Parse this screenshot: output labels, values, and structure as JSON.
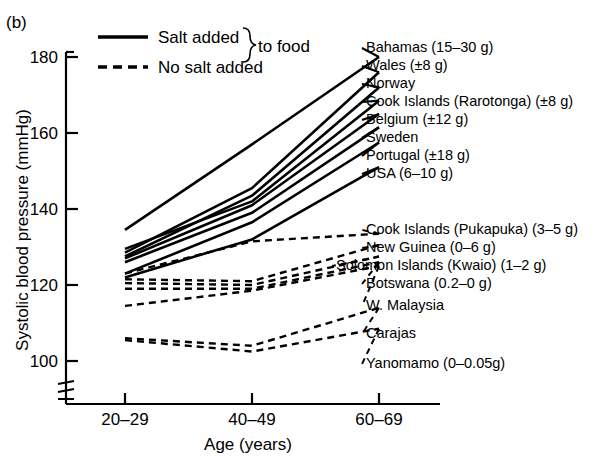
{
  "panel": {
    "letter": "(b)"
  },
  "legend": {
    "solid_label": "Salt added",
    "dashed_label": "No salt added",
    "brace_label": "to food"
  },
  "axes": {
    "y_title": "Systolic blood pressure (mmHg)",
    "x_title": "Age (years)",
    "y_ticks": [
      "180",
      "160",
      "140",
      "120",
      "100"
    ],
    "x_ticks": [
      "20–29",
      "40–49",
      "60–69"
    ],
    "y_break": "axis-break"
  },
  "chart_data": {
    "type": "line",
    "xlabel": "Age (years)",
    "ylabel": "Systolic blood pressure (mmHg)",
    "categories": [
      "20–29",
      "40–49",
      "60–69"
    ],
    "x": [
      25,
      45,
      65
    ],
    "ylim": [
      96,
      180
    ],
    "xlim": [
      20,
      70
    ],
    "grid": false,
    "legend": {
      "position": "top-left",
      "entries": [
        {
          "name": "Salt added",
          "style": "solid",
          "group": "to food"
        },
        {
          "name": "No salt added",
          "style": "dashed",
          "group": "to food"
        }
      ]
    },
    "series": [
      {
        "name": "Bahamas (15–30 g)",
        "label": "Bahamas (15–30 g)",
        "style": "solid",
        "values": [
          134.5,
          157.0,
          180.0
        ]
      },
      {
        "name": "Wales (±8 g)",
        "label": "Wales (±8 g)",
        "style": "solid",
        "values": [
          128.5,
          145.5,
          176.0
        ]
      },
      {
        "name": "Norway",
        "label": "Norway",
        "style": "solid",
        "values": [
          127.5,
          143.5,
          172.0
        ]
      },
      {
        "name": "Cook Islands (Rarotonga) (±8 g)",
        "label": "Cook Islands (Rarotonga) (±8 g)",
        "style": "solid",
        "values": [
          129.5,
          142.0,
          168.5
        ]
      },
      {
        "name": "Belgium (±12 g)",
        "label": "Belgium (±12 g)",
        "style": "solid",
        "values": [
          127.0,
          141.0,
          165.0
        ]
      },
      {
        "name": "Sweden",
        "label": "Sweden",
        "style": "solid",
        "values": [
          126.0,
          139.0,
          161.5
        ]
      },
      {
        "name": "Portugal (±18 g)",
        "label": "Portugal (±18 g)",
        "style": "solid",
        "values": [
          123.0,
          136.5,
          157.5
        ]
      },
      {
        "name": "USA (6–10 g)",
        "label": "USA (6–10 g)",
        "style": "solid",
        "values": [
          122.0,
          132.0,
          151.0
        ]
      },
      {
        "name": "Cook Islands (Pukapuka) (3–5 g)",
        "label": "Cook Islands (Pukapuka) (3–5 g)",
        "style": "dashed",
        "values": [
          123.0,
          131.5,
          133.5
        ]
      },
      {
        "name": "New Guinea (0–6 g)",
        "label": "New Guinea (0–6 g)",
        "style": "dashed",
        "values": [
          121.5,
          121.0,
          130.5
        ]
      },
      {
        "name": "Solomon Islands (Kwaio) (1–2 g)",
        "label": "Solomon Islands (Kwaio) (1–2 g)",
        "style": "dashed",
        "values": [
          120.5,
          120.0,
          127.5
        ]
      },
      {
        "name": "Botswana (0.2–0 g)",
        "label": "Botswana (0.2–0 g)",
        "style": "dashed",
        "values": [
          119.0,
          119.0,
          126.0
        ]
      },
      {
        "name": "W. Malaysia",
        "label": "W. Malaysia",
        "style": "dashed",
        "values": [
          114.5,
          118.5,
          125.0
        ]
      },
      {
        "name": "Carajas",
        "label": "Carajas",
        "style": "dashed",
        "values": [
          106.0,
          104.0,
          114.0
        ]
      },
      {
        "name": "Yanomamo (0–0.05g)",
        "label": "Yanomamo (0–0.05g)",
        "style": "dashed",
        "values": [
          105.5,
          102.5,
          108.5
        ]
      }
    ]
  }
}
